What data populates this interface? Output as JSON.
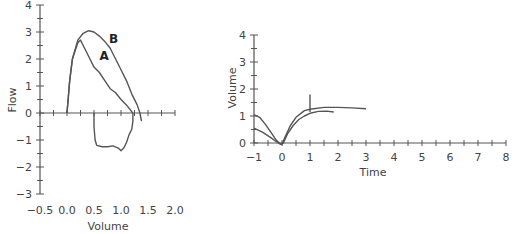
{
  "chart_data": [
    {
      "type": "line",
      "title": "",
      "xlabel": "Volume",
      "ylabel": "Flow",
      "xlim": [
        -0.5,
        2.0
      ],
      "ylim": [
        -3,
        4
      ],
      "x_tick_labels": [
        "−0.5",
        "0.0",
        "0.5",
        "1.0",
        "1.5",
        "2.0"
      ],
      "y_tick_labels": [
        "4",
        "3",
        "2",
        "1",
        "0",
        "−1",
        "−2",
        "−3"
      ],
      "grid": false,
      "annotations": [
        "A",
        "B"
      ],
      "series": [
        {
          "name": "A",
          "x": [
            0.0,
            0.05,
            0.1,
            0.2,
            0.25,
            0.3,
            0.4,
            0.5,
            0.6,
            0.7,
            0.8,
            0.9,
            1.0,
            1.1,
            1.2,
            1.22
          ],
          "y": [
            0.0,
            1.2,
            2.0,
            2.6,
            2.7,
            2.5,
            2.1,
            1.7,
            1.5,
            1.2,
            0.9,
            0.75,
            0.5,
            0.3,
            0.05,
            0.0
          ]
        },
        {
          "name": "B",
          "x": [
            0.0,
            0.05,
            0.1,
            0.2,
            0.3,
            0.4,
            0.5,
            0.6,
            0.7,
            0.8,
            0.9,
            1.0,
            1.1,
            1.2,
            1.3,
            1.35,
            1.38
          ],
          "y": [
            0.0,
            1.2,
            2.0,
            2.7,
            2.95,
            3.05,
            3.0,
            2.85,
            2.65,
            2.4,
            2.0,
            1.6,
            1.2,
            0.7,
            0.3,
            0.0,
            -0.3
          ]
        },
        {
          "name": "A-inspiratory",
          "x": [
            0.5,
            0.5,
            0.52,
            0.55,
            0.65,
            0.75,
            0.85,
            0.95,
            1.0,
            1.05,
            1.1,
            1.15,
            1.2,
            1.22,
            1.22
          ],
          "y": [
            0.0,
            -0.5,
            -1.0,
            -1.2,
            -1.25,
            -1.25,
            -1.22,
            -1.3,
            -1.4,
            -1.3,
            -1.1,
            -0.8,
            -0.6,
            -0.3,
            0.0
          ]
        }
      ]
    },
    {
      "type": "line",
      "title": "",
      "xlabel": "Time",
      "ylabel": "Volume",
      "xlim": [
        -1,
        8
      ],
      "ylim": [
        0,
        4
      ],
      "x_tick_labels": [
        "−1",
        "0",
        "1",
        "2",
        "3",
        "4",
        "5",
        "6",
        "7",
        "8"
      ],
      "y_tick_labels": [
        "4",
        "3",
        "2",
        "1",
        "0"
      ],
      "grid": false,
      "series": [
        {
          "name": "Curve 1",
          "x": [
            -1.0,
            -0.8,
            -0.6,
            -0.4,
            -0.2,
            -0.1,
            0.0,
            0.1,
            0.3,
            0.5,
            0.8,
            1.0,
            1.5,
            2.0,
            2.5,
            3.0
          ],
          "y": [
            1.05,
            0.95,
            0.7,
            0.4,
            0.1,
            0.0,
            -0.05,
            0.2,
            0.65,
            0.95,
            1.2,
            1.25,
            1.32,
            1.32,
            1.3,
            1.27
          ]
        },
        {
          "name": "Curve 2",
          "x": [
            -1.0,
            -0.7,
            -0.4,
            -0.2,
            -0.05,
            0.05,
            0.2,
            0.4,
            0.6,
            0.8,
            1.0,
            1.3,
            1.6,
            1.85
          ],
          "y": [
            0.55,
            0.4,
            0.2,
            0.05,
            -0.05,
            0.0,
            0.35,
            0.65,
            0.87,
            1.0,
            1.1,
            1.17,
            1.18,
            1.15
          ]
        },
        {
          "name": "Spike",
          "x": [
            1.0,
            1.0
          ],
          "y": [
            1.15,
            1.8
          ]
        }
      ]
    }
  ]
}
